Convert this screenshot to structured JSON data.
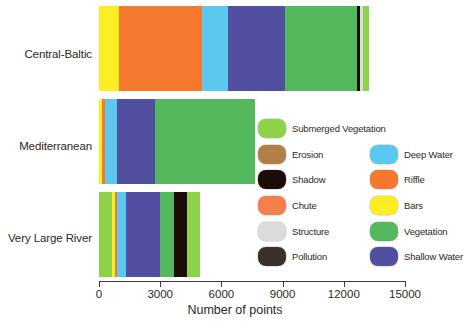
{
  "chart_data": {
    "type": "bar",
    "orientation": "horizontal",
    "stacked": true,
    "title": "",
    "xlabel": "Number of points",
    "ylabel": "",
    "xlim": [
      0,
      15000
    ],
    "xticks": [
      0,
      3000,
      6000,
      9000,
      12000,
      15000
    ],
    "xtick_labels": [
      "0",
      "3000",
      "6000",
      "9000",
      "12000",
      "15000"
    ],
    "grid": false,
    "legend_position": "inside-right",
    "categories": [
      "Central-Baltic",
      "Mediterranean",
      "Very Large River"
    ],
    "series": [
      {
        "name": "Submerged Vegetation",
        "color": "#8ed24a",
        "values": [
          310,
          0,
          1300
        ]
      },
      {
        "name": "Erosion",
        "color": "#b08046",
        "values": [
          0,
          0,
          0
        ]
      },
      {
        "name": "Shadow",
        "color": "#1a0d08",
        "values": [
          150,
          0,
          620
        ]
      },
      {
        "name": "Chute",
        "color": "#f5804a",
        "values": [
          0,
          0,
          0
        ]
      },
      {
        "name": "Structure",
        "color": "#dcdcdc",
        "values": [
          110,
          0,
          0
        ]
      },
      {
        "name": "Pollution",
        "color": "#3a312b",
        "values": [
          0,
          0,
          0
        ]
      },
      {
        "name": "Deep Water",
        "color": "#5bc8f0",
        "values": [
          1280,
          620,
          420
        ]
      },
      {
        "name": "Riffle",
        "color": "#f4792c",
        "values": [
          4060,
          150,
          120
        ]
      },
      {
        "name": "Bars",
        "color": "#fcee22",
        "values": [
          1000,
          130,
          130
        ]
      },
      {
        "name": "Vegetation",
        "color": "#54b95c",
        "values": [
          3530,
          4900,
          700
        ]
      },
      {
        "name": "Shallow Water",
        "color": "#524fa1",
        "values": [
          2790,
          1850,
          1660
        ]
      }
    ],
    "bar_stack_order": {
      "Central-Baltic": [
        "Bars",
        "Riffle",
        "Deep Water",
        "Shallow Water",
        "Vegetation",
        "Shadow",
        "Structure",
        "Submerged Vegetation"
      ],
      "Mediterranean": [
        "Bars",
        "Riffle",
        "Deep Water",
        "Shallow Water",
        "Vegetation"
      ],
      "Very Large River": [
        "Submerged Vegetation",
        "Bars",
        "Riffle",
        "Deep Water",
        "Shallow Water",
        "Vegetation",
        "Shadow",
        "Submerged Vegetation"
      ]
    },
    "totals": [
      13230,
      7650,
      4950
    ]
  },
  "axis": {
    "x_title": "Number of points",
    "tick_labels": [
      "0",
      "3000",
      "6000",
      "9000",
      "12000",
      "15000"
    ]
  },
  "categories": [
    {
      "label": "Central-Baltic"
    },
    {
      "label": "Mediterranean"
    },
    {
      "label": "Very Large River"
    }
  ],
  "legend": {
    "left_column": [
      {
        "label": "Submerged Vegetation",
        "color": "#8ed24a"
      },
      {
        "label": "Erosion",
        "color": "#b08046"
      },
      {
        "label": "Shadow",
        "color": "#1a0d08"
      },
      {
        "label": "Chute",
        "color": "#f5804a"
      },
      {
        "label": "Structure",
        "color": "#dcdcdc"
      },
      {
        "label": "Pollution",
        "color": "#3a312b"
      }
    ],
    "right_column": [
      {
        "label": "Deep Water",
        "color": "#5bc8f0"
      },
      {
        "label": "Riffle",
        "color": "#f4792c"
      },
      {
        "label": "Bars",
        "color": "#fcee22"
      },
      {
        "label": "Vegetation",
        "color": "#54b95c"
      },
      {
        "label": "Shallow Water",
        "color": "#524fa1"
      }
    ]
  }
}
